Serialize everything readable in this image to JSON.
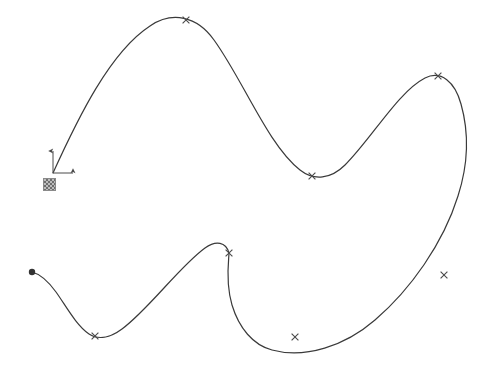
{
  "canvas": {
    "width": 497,
    "height": 374,
    "background_color": "#ffffff",
    "stroke_color": "#3a3a3a",
    "stroke_width": 1.2,
    "marker_color": "#4a4a4a"
  },
  "origin_widget": {
    "name": "origin-axis-indicator",
    "x": 53,
    "y": 173,
    "y_axis_label": "",
    "x_axis_label": "",
    "arrow_up_length": 22,
    "arrow_right_length": 20,
    "icon_square": {
      "x": 43,
      "y": 178,
      "size": 13,
      "fill_color": "#bdbdbd",
      "pattern_color": "#6e6e6e"
    }
  },
  "curve": {
    "name": "spline-curve",
    "closed": false,
    "path": "M 53,173 C 78,118 110,52 150,26 C 172,11 197,16 214,40 C 243,80 268,145 300,170 C 314,181 331,179 345,165 C 372,138 398,92 425,78 C 441,70 455,82 461,104 C 470,136 467,168 458,196 C 443,244 410,290 375,320 C 345,346 305,359 272,350 C 253,345 239,328 232,305 C 225,281 229,259 229,253 C 226,242 216,240 205,248 C 180,266 148,310 122,329 C 110,338 98,340 89,334 C 76,325 66,306 56,292 C 48,281 40,274 32,272"
  },
  "markers": [
    {
      "name": "control-point-1",
      "x": 186,
      "y": 20,
      "type": "cross"
    },
    {
      "name": "control-point-2",
      "x": 312,
      "y": 176,
      "type": "cross"
    },
    {
      "name": "control-point-3",
      "x": 438,
      "y": 76,
      "type": "cross"
    },
    {
      "name": "control-point-4",
      "x": 444,
      "y": 275,
      "type": "cross"
    },
    {
      "name": "control-point-5",
      "x": 295,
      "y": 337,
      "type": "cross"
    },
    {
      "name": "control-point-6",
      "x": 229,
      "y": 253,
      "type": "cross"
    },
    {
      "name": "control-point-7",
      "x": 95,
      "y": 336,
      "type": "cross"
    }
  ],
  "endpoint": {
    "name": "curve-start-endpoint",
    "x": 32,
    "y": 272,
    "radius": 3.2,
    "fill_color": "#333333"
  }
}
